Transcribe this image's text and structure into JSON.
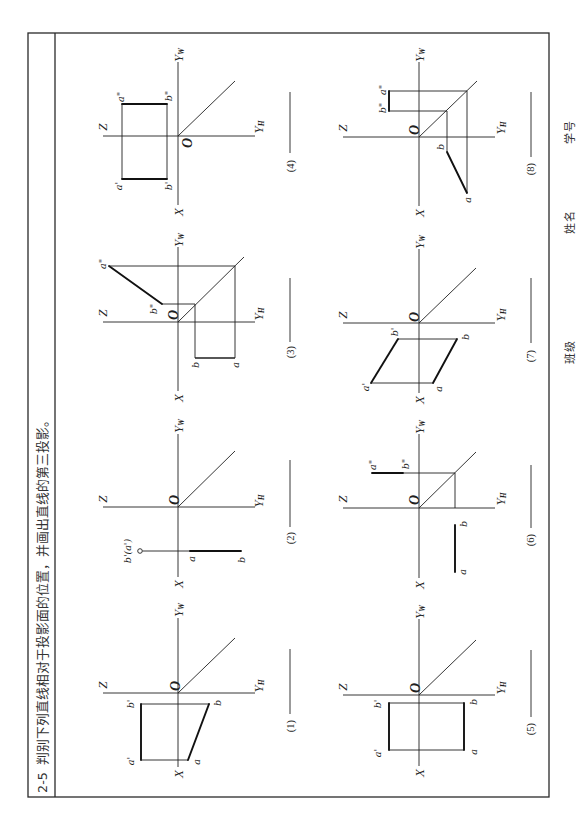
{
  "page": {
    "exercise_number": "2-5",
    "instruction": "判别下列直线相对于投影面的位置，并画出直线的第三投影。"
  },
  "axis_labels": {
    "x": "X",
    "z": "Z",
    "origin": "O",
    "y": "Y",
    "y_w_sub": "W",
    "y_h_sub": "H"
  },
  "figures": [
    {
      "caption": "(1)",
      "labels": {
        "a_prime": "a'",
        "b_prime": "b'",
        "a": "a",
        "b": "b"
      }
    },
    {
      "caption": "(2)",
      "labels": {
        "b_prime_a_prime": "b'(a')",
        "a": "a",
        "b": "b"
      }
    },
    {
      "caption": "(3)",
      "labels": {
        "a_dprime": "a\"",
        "b_dprime": "b\"",
        "a": "a",
        "b": "b"
      }
    },
    {
      "caption": "(4)",
      "labels": {
        "a_dprime": "a\"",
        "b_dprime": "b\"",
        "a_prime": "a'",
        "b_prime": "b'"
      }
    },
    {
      "caption": "(5)",
      "labels": {
        "a_prime": "a'",
        "b_prime": "b'",
        "a": "a",
        "b": "b"
      }
    },
    {
      "caption": "(6)",
      "labels": {
        "a_dprime": "a\"",
        "b_dprime": "b\"",
        "a": "a",
        "b": "b"
      }
    },
    {
      "caption": "(7)",
      "labels": {
        "a_prime": "a'",
        "b_prime": "b'",
        "a": "a",
        "b": "b"
      }
    },
    {
      "caption": "(8)",
      "labels": {
        "a_dprime": "a\"",
        "b_dprime": "b\"",
        "a": "a",
        "b": "b"
      }
    }
  ],
  "footer": {
    "class_label": "班级",
    "name_label": "姓名",
    "student_id_label": "学号"
  },
  "colors": {
    "ink": "#1f1f1f",
    "paper": "#ffffff"
  }
}
